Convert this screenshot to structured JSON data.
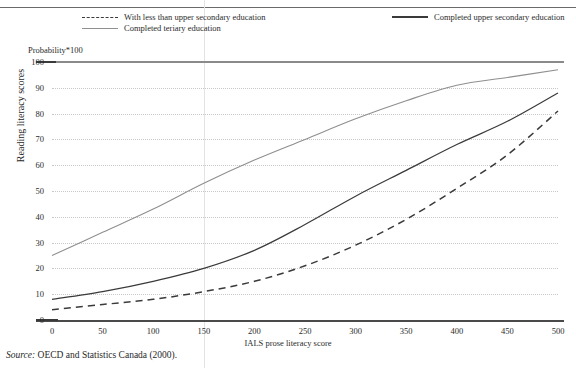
{
  "figure": {
    "probability_label": "Probability*100",
    "y_axis_title": "Reading literacy scores",
    "x_axis_title": "IALS prose literacy score",
    "source_prefix": "Source:",
    "source_text": "OECD and Statistics Canada (2000)."
  },
  "legend": {
    "items": [
      {
        "label": "With less than upper secondary education",
        "style": "dashed",
        "color": "#3a3a3a"
      },
      {
        "label": "Completed upper secondary education",
        "style": "solid",
        "color": "#3a3a3a"
      },
      {
        "label": "Completed teriary education",
        "style": "solid",
        "color": "#8f8f8f"
      }
    ]
  },
  "chart_data": {
    "type": "line",
    "title": "",
    "subtitle": "Probability*100",
    "xlabel": "IALS prose literacy score",
    "ylabel": "Reading literacy scores",
    "xlim": [
      0,
      500
    ],
    "ylim": [
      0,
      100
    ],
    "xticks": [
      0,
      50,
      100,
      150,
      200,
      250,
      300,
      350,
      400,
      450,
      500
    ],
    "yticks": [
      0,
      10,
      20,
      30,
      40,
      50,
      60,
      70,
      80,
      90,
      100
    ],
    "grid": "horizontal-dotted",
    "legend_position": "above-plot",
    "x": [
      0,
      50,
      100,
      150,
      200,
      250,
      300,
      350,
      400,
      450,
      500
    ],
    "series": [
      {
        "name": "With less than upper secondary education",
        "style": "dashed",
        "color": "#3a3a3a",
        "values": [
          4,
          6,
          8,
          11,
          15,
          21,
          29,
          39,
          51,
          64,
          81
        ]
      },
      {
        "name": "Completed upper secondary education",
        "style": "solid",
        "color": "#3a3a3a",
        "values": [
          8,
          11,
          15,
          20,
          27,
          37,
          48,
          58,
          68,
          77,
          88
        ]
      },
      {
        "name": "Completed teriary education",
        "style": "solid",
        "color": "#8f8f8f",
        "values": [
          25,
          34,
          43,
          53,
          62,
          70,
          78,
          85,
          91,
          94,
          97
        ]
      }
    ]
  },
  "axis": {
    "y_tick_labels": [
      "100",
      "90",
      "80",
      "70",
      "60",
      "50",
      "40",
      "30",
      "20",
      "10",
      "0"
    ],
    "x_tick_labels": [
      "0",
      "50",
      "100",
      "150",
      "200",
      "250",
      "300",
      "350",
      "400",
      "450",
      "500"
    ]
  }
}
